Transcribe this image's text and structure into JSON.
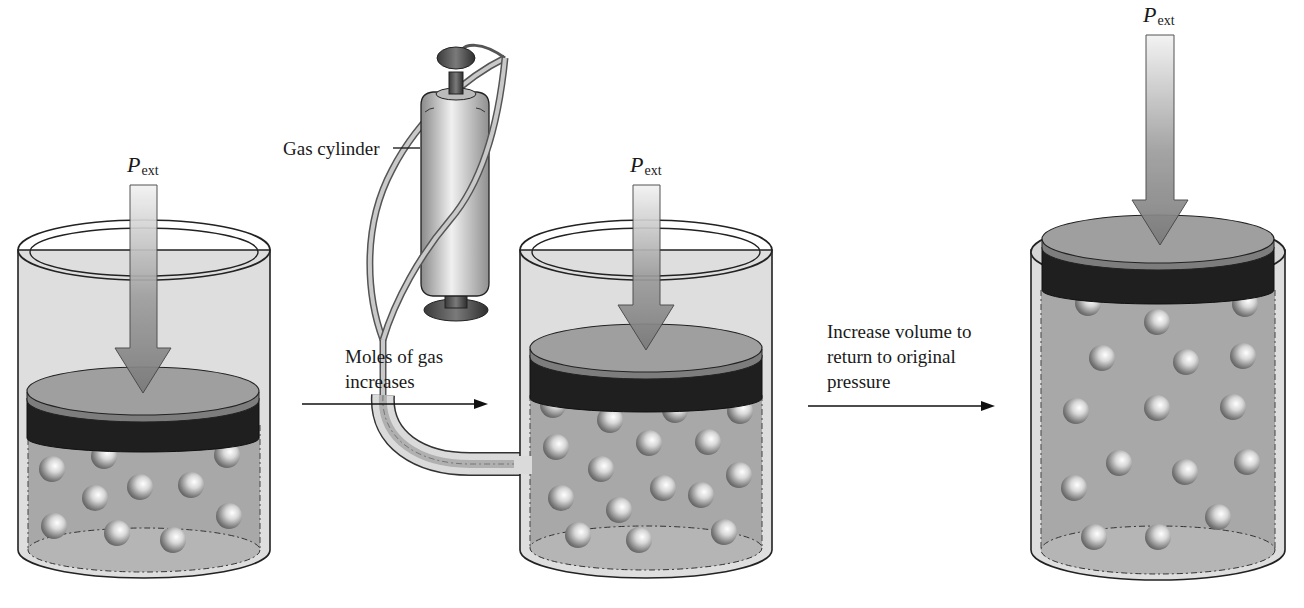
{
  "figure": {
    "stages": [
      {
        "id": "initial",
        "pressure_label": {
          "symbol": "P",
          "subscript": "ext"
        },
        "piston_height": "low",
        "gas_particle_count": 11
      },
      {
        "id": "gas-added",
        "pressure_label": {
          "symbol": "P",
          "subscript": "ext"
        },
        "piston_height": "low",
        "gas_particle_count": 18
      },
      {
        "id": "expanded",
        "pressure_label": {
          "symbol": "P",
          "subscript": "ext"
        },
        "piston_height": "high",
        "gas_particle_count": 18
      }
    ],
    "gas_cylinder_label": "Gas cylinder",
    "transitions": [
      {
        "line1": "Moles of gas",
        "line2": "increases"
      },
      {
        "line1": "Increase volume to",
        "line2": "return to original",
        "line3": "pressure"
      }
    ],
    "colors": {
      "cylinder_wall": "#dcdcdc",
      "gas_fill": "#a9a9a9",
      "piston_top": "#9a9a9a",
      "piston_band": "#1e1e1e",
      "arrow": "#8c8c8c",
      "outline": "#222222"
    }
  }
}
